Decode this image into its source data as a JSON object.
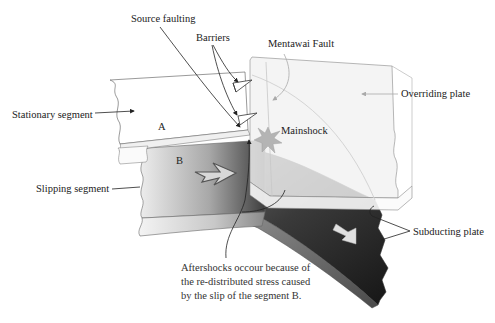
{
  "labels": {
    "source_faulting": "Source faulting",
    "barriers": "Barriers",
    "mentawai_fault": "Mentawai Fault",
    "overriding_plate": "Overriding plate",
    "stationary_segment": "Stationary segment",
    "segment_a": "A",
    "segment_b": "B",
    "mainshock": "Mainshock",
    "slipping_segment": "Slipping segment",
    "subducting_plate": "Subducting plate",
    "aftershocks_line1": "Aftershocks occour because of",
    "aftershocks_line2": "the re-distributed stress caused",
    "aftershocks_line3": "by the slip of the segment B."
  },
  "colors": {
    "background": "#ffffff",
    "stationary_fill": "#ffffff",
    "slipping_light": "#e8e8e8",
    "slipping_dark": "#4a4a4a",
    "subducting_dark": "#1e1e1e",
    "overriding_fill": "#f4f4f4",
    "mainshock": "#b0b0b0",
    "outline": "#555555"
  }
}
